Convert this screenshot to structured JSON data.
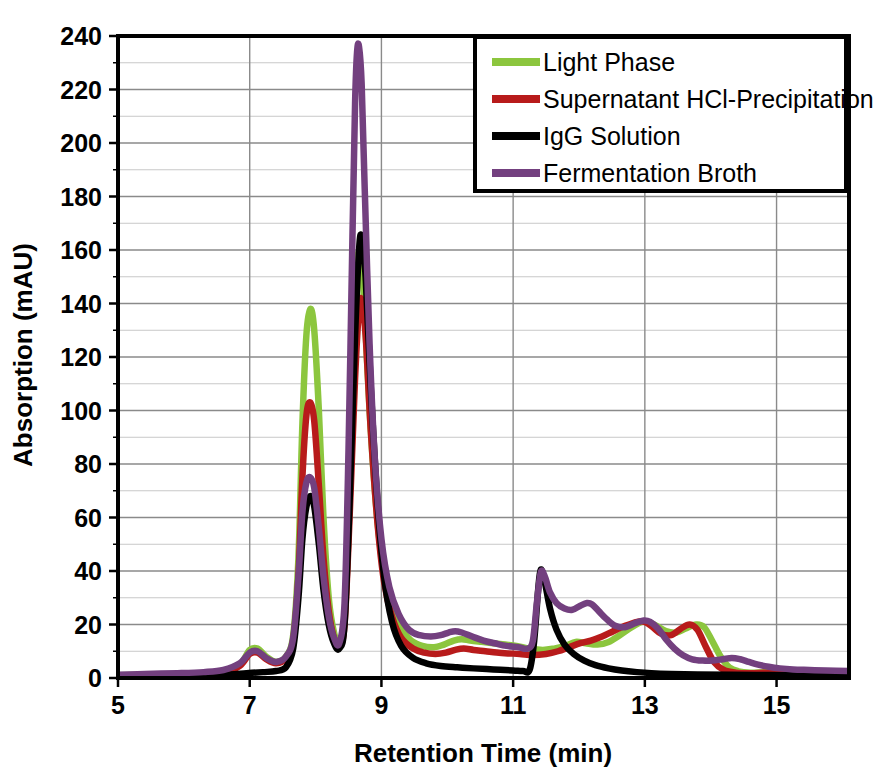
{
  "chart_data": {
    "type": "line",
    "title": "",
    "xlabel": "Retention Time  (min)",
    "ylabel": "Absorption (mAU)",
    "xlim": [
      5,
      16.1
    ],
    "ylim": [
      0,
      240
    ],
    "xticks": [
      5,
      7,
      9,
      11,
      13,
      15
    ],
    "yticks": [
      0,
      20,
      40,
      60,
      80,
      100,
      120,
      140,
      160,
      180,
      200,
      220,
      240
    ],
    "xtick_labels": [
      "5",
      "7",
      "9",
      "11",
      "13",
      "15"
    ],
    "ytick_labels": [
      "0",
      "20",
      "40",
      "60",
      "80",
      "100",
      "120",
      "140",
      "160",
      "180",
      "200",
      "220",
      "240"
    ],
    "grid": true,
    "grid_minor_y_step": 10,
    "legend_position": "top-right",
    "series": [
      {
        "name": "Light Phase",
        "color": "#8CC63E",
        "points": [
          [
            5.0,
            1.0
          ],
          [
            5.4,
            1.2
          ],
          [
            5.9,
            1.4
          ],
          [
            6.3,
            1.6
          ],
          [
            6.6,
            2.2
          ],
          [
            6.85,
            5.0
          ],
          [
            7.0,
            10.5
          ],
          [
            7.12,
            11.0
          ],
          [
            7.25,
            8.0
          ],
          [
            7.4,
            6.0
          ],
          [
            7.55,
            8.0
          ],
          [
            7.66,
            16.0
          ],
          [
            7.74,
            45.0
          ],
          [
            7.8,
            95.0
          ],
          [
            7.86,
            128.0
          ],
          [
            7.92,
            138.0
          ],
          [
            7.98,
            130.0
          ],
          [
            8.05,
            100.0
          ],
          [
            8.12,
            60.0
          ],
          [
            8.2,
            30.0
          ],
          [
            8.28,
            17.0
          ],
          [
            8.36,
            13.0
          ],
          [
            8.44,
            22.0
          ],
          [
            8.52,
            70.0
          ],
          [
            8.58,
            125.0
          ],
          [
            8.63,
            155.0
          ],
          [
            8.68,
            158.0
          ],
          [
            8.74,
            140.0
          ],
          [
            8.82,
            100.0
          ],
          [
            8.92,
            64.0
          ],
          [
            9.02,
            42.0
          ],
          [
            9.14,
            28.0
          ],
          [
            9.28,
            19.0
          ],
          [
            9.45,
            14.0
          ],
          [
            9.62,
            12.0
          ],
          [
            9.8,
            11.5
          ],
          [
            9.95,
            12.5
          ],
          [
            10.1,
            14.0
          ],
          [
            10.22,
            14.5
          ],
          [
            10.35,
            14.0
          ],
          [
            10.52,
            13.5
          ],
          [
            10.7,
            13.0
          ],
          [
            10.88,
            12.5
          ],
          [
            11.05,
            12.0
          ],
          [
            11.25,
            11.0
          ],
          [
            11.45,
            10.5
          ],
          [
            11.62,
            11.0
          ],
          [
            11.8,
            12.0
          ],
          [
            11.95,
            13.5
          ],
          [
            12.1,
            13.0
          ],
          [
            12.28,
            12.5
          ],
          [
            12.45,
            13.5
          ],
          [
            12.62,
            16.0
          ],
          [
            12.8,
            19.0
          ],
          [
            12.95,
            21.0
          ],
          [
            13.05,
            21.0
          ],
          [
            13.18,
            19.5
          ],
          [
            13.32,
            17.5
          ],
          [
            13.48,
            17.0
          ],
          [
            13.62,
            18.5
          ],
          [
            13.78,
            20.0
          ],
          [
            13.9,
            19.0
          ],
          [
            14.02,
            14.0
          ],
          [
            14.15,
            8.0
          ],
          [
            14.28,
            4.0
          ],
          [
            14.42,
            2.5
          ],
          [
            14.6,
            2.0
          ],
          [
            14.85,
            2.2
          ],
          [
            15.1,
            2.0
          ],
          [
            15.4,
            1.8
          ],
          [
            15.7,
            1.6
          ],
          [
            16.1,
            1.5
          ]
        ]
      },
      {
        "name": "Supernatant HCl-Precipitation",
        "color": "#B81B1B",
        "points": [
          [
            5.0,
            1.0
          ],
          [
            5.4,
            1.1
          ],
          [
            5.9,
            1.3
          ],
          [
            6.3,
            1.5
          ],
          [
            6.6,
            2.0
          ],
          [
            6.85,
            4.5
          ],
          [
            7.0,
            9.0
          ],
          [
            7.12,
            9.5
          ],
          [
            7.25,
            7.0
          ],
          [
            7.4,
            5.5
          ],
          [
            7.55,
            7.5
          ],
          [
            7.66,
            14.0
          ],
          [
            7.74,
            38.0
          ],
          [
            7.8,
            75.0
          ],
          [
            7.86,
            98.0
          ],
          [
            7.92,
            103.0
          ],
          [
            7.98,
            96.0
          ],
          [
            8.05,
            72.0
          ],
          [
            8.12,
            45.0
          ],
          [
            8.2,
            25.0
          ],
          [
            8.28,
            15.0
          ],
          [
            8.36,
            12.0
          ],
          [
            8.44,
            20.0
          ],
          [
            8.52,
            62.0
          ],
          [
            8.6,
            112.0
          ],
          [
            8.66,
            138.0
          ],
          [
            8.7,
            141.0
          ],
          [
            8.76,
            128.0
          ],
          [
            8.84,
            92.0
          ],
          [
            8.94,
            58.0
          ],
          [
            9.04,
            36.0
          ],
          [
            9.16,
            23.0
          ],
          [
            9.3,
            15.0
          ],
          [
            9.48,
            11.0
          ],
          [
            9.65,
            9.5
          ],
          [
            9.82,
            9.0
          ],
          [
            9.98,
            9.5
          ],
          [
            10.12,
            10.5
          ],
          [
            10.25,
            11.0
          ],
          [
            10.4,
            10.5
          ],
          [
            10.58,
            10.0
          ],
          [
            10.75,
            9.5
          ],
          [
            10.92,
            9.2
          ],
          [
            11.1,
            9.0
          ],
          [
            11.3,
            8.6
          ],
          [
            11.5,
            9.0
          ],
          [
            11.68,
            10.0
          ],
          [
            11.85,
            11.5
          ],
          [
            12.02,
            13.0
          ],
          [
            12.18,
            14.0
          ],
          [
            12.35,
            15.5
          ],
          [
            12.52,
            17.5
          ],
          [
            12.7,
            19.5
          ],
          [
            12.88,
            21.0
          ],
          [
            13.0,
            21.0
          ],
          [
            13.12,
            19.0
          ],
          [
            13.25,
            16.5
          ],
          [
            13.4,
            16.0
          ],
          [
            13.55,
            18.5
          ],
          [
            13.68,
            20.0
          ],
          [
            13.8,
            18.0
          ],
          [
            13.92,
            12.0
          ],
          [
            14.05,
            6.0
          ],
          [
            14.2,
            3.0
          ],
          [
            14.38,
            2.0
          ],
          [
            14.6,
            1.8
          ],
          [
            14.9,
            2.0
          ],
          [
            15.2,
            1.8
          ],
          [
            15.5,
            1.6
          ],
          [
            15.8,
            1.5
          ],
          [
            16.1,
            1.4
          ]
        ]
      },
      {
        "name": "IgG Solution",
        "color": "#000000",
        "points": [
          [
            5.0,
            0.8
          ],
          [
            5.5,
            0.9
          ],
          [
            6.0,
            1.0
          ],
          [
            6.4,
            1.1
          ],
          [
            6.7,
            1.3
          ],
          [
            6.95,
            1.8
          ],
          [
            7.2,
            2.2
          ],
          [
            7.4,
            2.6
          ],
          [
            7.55,
            4.0
          ],
          [
            7.66,
            11.0
          ],
          [
            7.74,
            30.0
          ],
          [
            7.8,
            52.0
          ],
          [
            7.86,
            64.0
          ],
          [
            7.92,
            68.0
          ],
          [
            7.98,
            64.0
          ],
          [
            8.05,
            50.0
          ],
          [
            8.12,
            33.0
          ],
          [
            8.2,
            20.0
          ],
          [
            8.28,
            13.0
          ],
          [
            8.36,
            11.0
          ],
          [
            8.44,
            20.0
          ],
          [
            8.52,
            68.0
          ],
          [
            8.6,
            128.0
          ],
          [
            8.66,
            160.0
          ],
          [
            8.7,
            165.0
          ],
          [
            8.76,
            150.0
          ],
          [
            8.84,
            108.0
          ],
          [
            8.94,
            66.0
          ],
          [
            9.04,
            38.0
          ],
          [
            9.16,
            21.0
          ],
          [
            9.3,
            12.0
          ],
          [
            9.48,
            7.5
          ],
          [
            9.68,
            5.5
          ],
          [
            9.9,
            4.5
          ],
          [
            10.15,
            4.0
          ],
          [
            10.4,
            3.6
          ],
          [
            10.7,
            3.2
          ],
          [
            11.0,
            2.8
          ],
          [
            11.15,
            2.6
          ],
          [
            11.25,
            3.0
          ],
          [
            11.32,
            14.0
          ],
          [
            11.38,
            33.0
          ],
          [
            11.42,
            40.5
          ],
          [
            11.48,
            36.0
          ],
          [
            11.56,
            26.0
          ],
          [
            11.66,
            18.0
          ],
          [
            11.78,
            12.5
          ],
          [
            11.92,
            9.0
          ],
          [
            12.08,
            6.5
          ],
          [
            12.25,
            4.8
          ],
          [
            12.45,
            3.6
          ],
          [
            12.65,
            2.8
          ],
          [
            12.88,
            2.2
          ],
          [
            13.1,
            1.8
          ],
          [
            13.4,
            1.5
          ],
          [
            13.8,
            1.3
          ],
          [
            14.3,
            1.2
          ],
          [
            14.9,
            1.1
          ],
          [
            15.5,
            1.0
          ],
          [
            16.1,
            1.0
          ]
        ]
      },
      {
        "name": "Fermentation Broth",
        "color": "#73407F",
        "points": [
          [
            5.0,
            1.2
          ],
          [
            5.4,
            1.5
          ],
          [
            5.9,
            1.8
          ],
          [
            6.3,
            2.2
          ],
          [
            6.6,
            3.0
          ],
          [
            6.85,
            5.5
          ],
          [
            7.0,
            9.5
          ],
          [
            7.12,
            10.0
          ],
          [
            7.25,
            7.5
          ],
          [
            7.4,
            6.0
          ],
          [
            7.55,
            8.0
          ],
          [
            7.66,
            15.0
          ],
          [
            7.74,
            38.0
          ],
          [
            7.8,
            62.0
          ],
          [
            7.86,
            73.0
          ],
          [
            7.92,
            75.0
          ],
          [
            7.98,
            71.0
          ],
          [
            8.05,
            56.0
          ],
          [
            8.12,
            38.0
          ],
          [
            8.2,
            23.0
          ],
          [
            8.28,
            15.0
          ],
          [
            8.36,
            13.0
          ],
          [
            8.44,
            28.0
          ],
          [
            8.5,
            85.0
          ],
          [
            8.56,
            165.0
          ],
          [
            8.6,
            215.0
          ],
          [
            8.63,
            234.0
          ],
          [
            8.66,
            236.0
          ],
          [
            8.7,
            222.0
          ],
          [
            8.75,
            180.0
          ],
          [
            8.82,
            125.0
          ],
          [
            8.9,
            82.0
          ],
          [
            9.0,
            52.0
          ],
          [
            9.12,
            34.0
          ],
          [
            9.26,
            24.0
          ],
          [
            9.42,
            18.0
          ],
          [
            9.58,
            16.0
          ],
          [
            9.75,
            15.5
          ],
          [
            9.9,
            16.0
          ],
          [
            10.02,
            17.0
          ],
          [
            10.12,
            17.5
          ],
          [
            10.22,
            17.0
          ],
          [
            10.38,
            15.5
          ],
          [
            10.55,
            14.0
          ],
          [
            10.72,
            13.0
          ],
          [
            10.9,
            12.0
          ],
          [
            11.08,
            11.5
          ],
          [
            11.22,
            11.0
          ],
          [
            11.3,
            14.0
          ],
          [
            11.36,
            28.0
          ],
          [
            11.42,
            39.5
          ],
          [
            11.48,
            38.0
          ],
          [
            11.56,
            32.0
          ],
          [
            11.66,
            28.0
          ],
          [
            11.78,
            26.0
          ],
          [
            11.9,
            25.5
          ],
          [
            12.02,
            27.0
          ],
          [
            12.12,
            28.0
          ],
          [
            12.2,
            27.5
          ],
          [
            12.3,
            25.0
          ],
          [
            12.42,
            22.0
          ],
          [
            12.55,
            19.5
          ],
          [
            12.7,
            19.0
          ],
          [
            12.85,
            20.5
          ],
          [
            12.98,
            21.5
          ],
          [
            13.08,
            21.0
          ],
          [
            13.2,
            18.5
          ],
          [
            13.32,
            14.5
          ],
          [
            13.45,
            11.0
          ],
          [
            13.58,
            8.5
          ],
          [
            13.72,
            7.0
          ],
          [
            13.88,
            6.5
          ],
          [
            14.02,
            6.5
          ],
          [
            14.18,
            7.0
          ],
          [
            14.32,
            7.5
          ],
          [
            14.45,
            7.0
          ],
          [
            14.58,
            6.0
          ],
          [
            14.72,
            5.0
          ],
          [
            14.88,
            4.2
          ],
          [
            15.05,
            3.6
          ],
          [
            15.25,
            3.2
          ],
          [
            15.5,
            3.0
          ],
          [
            15.75,
            2.8
          ],
          [
            16.1,
            2.6
          ]
        ]
      }
    ]
  },
  "legend": {
    "items": [
      {
        "label": "Light Phase",
        "color": "#8CC63E"
      },
      {
        "label": "Supernatant HCl-Precipitation",
        "color": "#B81B1B"
      },
      {
        "label": "IgG Solution",
        "color": "#000000"
      },
      {
        "label": "Fermentation Broth",
        "color": "#73407F"
      }
    ]
  },
  "axes": {
    "x_title": "Retention Time  (min)",
    "y_title": "Absorption (mAU)"
  },
  "colors": {
    "grid": "#8a8a8a",
    "grid_minor": "#c8c8c8",
    "frame": "#000000",
    "background": "#ffffff"
  }
}
